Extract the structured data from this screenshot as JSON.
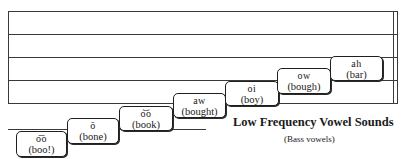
{
  "diagram": {
    "title": "Low Frequency Vowel Sounds",
    "subtitle": "(Bass vowels)",
    "staff": {
      "line_count": 5,
      "has_ledger_line_below": true,
      "right_double_bar": true
    },
    "notes": [
      {
        "vowel": "o͞o",
        "word": "(boo!)"
      },
      {
        "vowel": "ō",
        "word": "(bone)"
      },
      {
        "vowel": "o͝o",
        "word": "(book)"
      },
      {
        "vowel": "aw",
        "word": "(bought)"
      },
      {
        "vowel": "oi",
        "word": "(boy)"
      },
      {
        "vowel": "ow",
        "word": "(bough)"
      },
      {
        "vowel": "ah",
        "word": "(bar)"
      }
    ]
  }
}
